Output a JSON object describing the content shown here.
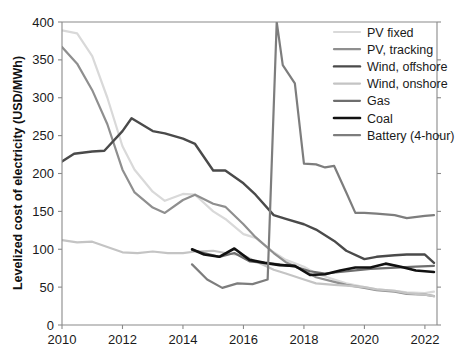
{
  "chart_data": {
    "type": "line",
    "title": "",
    "xlabel": "",
    "ylabel": "Levelized cost of electricity (USD/MWh)",
    "xlim": [
      2010,
      2022.4
    ],
    "ylim": [
      0,
      400
    ],
    "xticks": [
      2010,
      2012,
      2014,
      2016,
      2018,
      2020,
      2022
    ],
    "xtick_labels": [
      "2010",
      "2012",
      "2014",
      "2016",
      "2018",
      "2020",
      "2022"
    ],
    "yticks": [
      0,
      50,
      100,
      150,
      200,
      250,
      300,
      350,
      400
    ],
    "ytick_labels": [
      "0",
      "50",
      "100",
      "150",
      "200",
      "250",
      "300",
      "350",
      "400"
    ],
    "grid": false,
    "legend_position": "top-right",
    "series": [
      {
        "name": "PV fixed",
        "color": "#d9d9d9",
        "width": 2.2,
        "x": [
          2010.0,
          2010.5,
          2011.0,
          2011.5,
          2012.0,
          2012.4,
          2013.0,
          2013.4,
          2014.0,
          2014.4,
          2015.0,
          2015.4,
          2016.0,
          2016.4,
          2017.0,
          2017.4,
          2018.0,
          2018.4,
          2019.0,
          2019.4,
          2020.0,
          2020.4,
          2021.0,
          2021.4,
          2022.0,
          2022.3
        ],
        "y": [
          389,
          385,
          355,
          300,
          236,
          205,
          176,
          164,
          173,
          172,
          150,
          140,
          120,
          115,
          96,
          86,
          77,
          68,
          60,
          55,
          50,
          47,
          45,
          43,
          42,
          44
        ]
      },
      {
        "name": "PV, tracking",
        "color": "#8f8f8f",
        "width": 2.2,
        "x": [
          2010.0,
          2010.5,
          2011.0,
          2011.5,
          2012.0,
          2012.4,
          2013.0,
          2013.4,
          2014.0,
          2014.4,
          2015.0,
          2015.4,
          2016.0,
          2016.4,
          2017.0,
          2017.4,
          2018.0,
          2018.4,
          2019.0,
          2019.4,
          2020.0,
          2020.4,
          2021.0,
          2021.4,
          2022.0,
          2022.3
        ],
        "y": [
          367,
          345,
          310,
          265,
          205,
          175,
          155,
          148,
          165,
          172,
          160,
          156,
          133,
          116,
          95,
          83,
          72,
          63,
          57,
          53,
          49,
          46,
          44,
          41,
          40,
          38
        ]
      },
      {
        "name": "Wind, offshore",
        "color": "#4a4a4a",
        "width": 2.4,
        "x": [
          2010.0,
          2010.4,
          2011.0,
          2011.4,
          2012.0,
          2012.3,
          2013.0,
          2013.4,
          2014.0,
          2014.4,
          2015.0,
          2015.4,
          2016.0,
          2016.4,
          2017.0,
          2017.4,
          2018.0,
          2018.4,
          2019.0,
          2019.4,
          2020.0,
          2020.4,
          2021.0,
          2021.4,
          2022.0,
          2022.3
        ],
        "y": [
          216,
          226,
          229,
          230,
          256,
          273,
          256,
          253,
          246,
          239,
          204,
          204,
          187,
          172,
          145,
          140,
          133,
          126,
          111,
          98,
          87,
          90,
          92,
          93,
          93,
          82
        ]
      },
      {
        "name": "Wind, onshore",
        "color": "#c4c4c4",
        "width": 2.2,
        "x": [
          2010.0,
          2010.5,
          2011.0,
          2011.5,
          2012.0,
          2012.5,
          2013.0,
          2013.5,
          2014.0,
          2014.4,
          2015.0,
          2015.4,
          2016.0,
          2016.4,
          2017.0,
          2017.4,
          2018.0,
          2018.4,
          2019.0,
          2019.4,
          2020.0,
          2020.4,
          2021.0,
          2021.4,
          2022.0,
          2022.3
        ],
        "y": [
          112,
          109,
          110,
          103,
          96,
          95,
          97,
          95,
          95,
          97,
          98,
          95,
          92,
          84,
          73,
          68,
          60,
          55,
          53,
          52,
          50,
          47,
          45,
          42,
          40,
          38
        ]
      },
      {
        "name": "Gas",
        "color": "#6e6e6e",
        "width": 2.2,
        "x": [
          2014.3,
          2014.7,
          2015.2,
          2015.7,
          2016.2,
          2016.7,
          2017.2,
          2017.7,
          2018.2,
          2018.7,
          2019.2,
          2019.7,
          2020.2,
          2020.7,
          2021.2,
          2021.7,
          2022.3
        ],
        "y": [
          99,
          95,
          90,
          95,
          84,
          82,
          80,
          77,
          71,
          68,
          70,
          72,
          74,
          75,
          76,
          77,
          78
        ]
      },
      {
        "name": "Coal",
        "color": "#111111",
        "width": 2.6,
        "x": [
          2014.3,
          2014.7,
          2015.2,
          2015.7,
          2016.2,
          2016.7,
          2017.2,
          2017.7,
          2018.2,
          2018.7,
          2019.2,
          2019.7,
          2020.2,
          2020.7,
          2021.2,
          2021.7,
          2022.3
        ],
        "y": [
          100,
          93,
          90,
          101,
          86,
          82,
          79,
          78,
          66,
          67,
          72,
          76,
          76,
          81,
          77,
          72,
          70
        ]
      },
      {
        "name": "Battery (4-hour)",
        "color": "#7d7d7d",
        "width": 2.2,
        "x": [
          2014.3,
          2014.8,
          2015.3,
          2015.8,
          2016.3,
          2016.8,
          2017.1,
          2017.3,
          2017.7,
          2018.0,
          2018.4,
          2018.7,
          2019.0,
          2019.4,
          2019.7,
          2020.0,
          2020.4,
          2021.0,
          2021.4,
          2022.0,
          2022.3
        ],
        "y": [
          80,
          60,
          49,
          55,
          54,
          60,
          400,
          343,
          319,
          213,
          212,
          208,
          210,
          175,
          148,
          148,
          147,
          145,
          141,
          144,
          145
        ]
      }
    ]
  },
  "legend": {
    "items": [
      {
        "label": "PV fixed"
      },
      {
        "label": "PV, tracking"
      },
      {
        "label": "Wind, offshore"
      },
      {
        "label": "Wind, onshore"
      },
      {
        "label": "Gas"
      },
      {
        "label": "Coal"
      },
      {
        "label": "Battery (4-hour)"
      }
    ]
  }
}
